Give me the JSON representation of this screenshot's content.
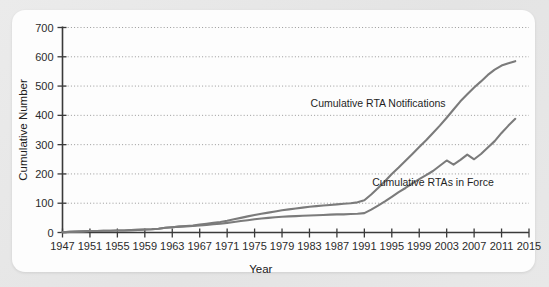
{
  "figure": {
    "background_color": "#e7e7e7",
    "card_color": "#fdfdfd"
  },
  "chart_data": {
    "type": "line",
    "title": "",
    "xlabel": "Year",
    "ylabel": "Cumulative Number",
    "xlim": [
      1947,
      2015
    ],
    "ylim": [
      0,
      700
    ],
    "grid": "horizontal-dotted",
    "legend_position": "inline-annotation",
    "x_ticks": [
      1947,
      1951,
      1955,
      1959,
      1963,
      1967,
      1971,
      1975,
      1979,
      1983,
      1987,
      1991,
      1995,
      1999,
      2003,
      2007,
      2011,
      2015
    ],
    "y_ticks": [
      0,
      100,
      200,
      300,
      400,
      500,
      600,
      700
    ],
    "line_color": "#7b7b7b",
    "axis_color": "#3a3a3a",
    "grid_color": "#9a9a9a",
    "x": [
      1947,
      1948,
      1949,
      1950,
      1951,
      1952,
      1953,
      1954,
      1955,
      1956,
      1957,
      1958,
      1959,
      1960,
      1961,
      1962,
      1963,
      1964,
      1965,
      1966,
      1967,
      1968,
      1969,
      1970,
      1971,
      1972,
      1973,
      1974,
      1975,
      1976,
      1977,
      1978,
      1979,
      1980,
      1981,
      1982,
      1983,
      1984,
      1985,
      1986,
      1987,
      1988,
      1989,
      1990,
      1991,
      1992,
      1993,
      1994,
      1995,
      1996,
      1997,
      1998,
      1999,
      2000,
      2001,
      2002,
      2003,
      2004,
      2005,
      2006,
      2007,
      2008,
      2009,
      2010,
      2011,
      2012,
      2013
    ],
    "series": [
      {
        "name": "Cumulative RTA Notifications",
        "label": "Cumulative RTA Notifications",
        "label_x": 1993,
        "label_y": 430,
        "values": [
          1,
          2,
          3,
          4,
          5,
          5,
          6,
          6,
          7,
          7,
          8,
          9,
          10,
          11,
          13,
          16,
          18,
          20,
          22,
          24,
          27,
          30,
          33,
          36,
          40,
          45,
          50,
          55,
          60,
          64,
          68,
          72,
          76,
          79,
          82,
          85,
          88,
          90,
          92,
          94,
          96,
          98,
          100,
          103,
          110,
          130,
          152,
          175,
          200,
          222,
          245,
          268,
          292,
          315,
          340,
          365,
          392,
          420,
          448,
          472,
          495,
          516,
          538,
          556,
          570,
          578,
          585
        ]
      },
      {
        "name": "Cumulative RTAs in Force",
        "label": "Cumulative RTAs in Force",
        "label_x": 2001,
        "label_y": 160,
        "values": [
          1,
          2,
          3,
          4,
          5,
          5,
          6,
          6,
          7,
          7,
          8,
          9,
          10,
          11,
          13,
          16,
          18,
          20,
          21,
          22,
          24,
          26,
          28,
          30,
          33,
          36,
          39,
          42,
          45,
          48,
          50,
          52,
          54,
          55,
          56,
          57,
          58,
          59,
          60,
          61,
          62,
          62,
          63,
          64,
          66,
          78,
          92,
          106,
          122,
          138,
          152,
          168,
          182,
          196,
          210,
          228,
          246,
          232,
          248,
          266,
          250,
          268,
          290,
          312,
          340,
          365,
          388
        ]
      }
    ]
  }
}
